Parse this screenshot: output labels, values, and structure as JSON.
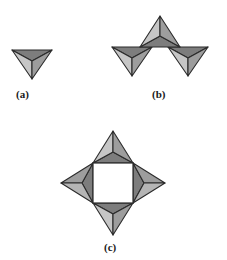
{
  "figure": {
    "background_color": "#ffffff",
    "stroke_color": "#2b2b2b",
    "panels": [
      {
        "id": "a",
        "label": "(a)",
        "caption_text": "(a)",
        "tetrahedra_count": 1,
        "orientation": "apex-down",
        "center": {
          "x": 32,
          "y": 60
        }
      },
      {
        "id": "b",
        "label": "(b)",
        "caption_text": "(b)",
        "tetrahedra_count": 3,
        "orientation": "corner-linked chain: up, down, down",
        "center": {
          "x": 160,
          "y": 52
        }
      },
      {
        "id": "c",
        "label": "(c)",
        "caption_text": "(c)",
        "tetrahedra_count": 4,
        "orientation": "four-membered ring around central square void",
        "center": {
          "x": 113,
          "y": 183
        }
      }
    ],
    "colors": {
      "face_dark": "#7d7d7d",
      "face_medium": "#9d9d9d",
      "face_light": "#c6c6c6",
      "face_lighter": "#b5b5b5",
      "outline": "#2b2b2b",
      "void_fill": "#ffffff"
    },
    "labels": {
      "a": "(a)",
      "b": "(b)",
      "c": "(c)"
    },
    "geometry": {
      "tet_down": {
        "note": "apex-down tetrahedron: top-left, top-right, mid-front-top, bottom apex",
        "points": {
          "tl": [
            -20,
            -10
          ],
          "tr": [
            20,
            -10
          ],
          "mid": [
            0,
            1
          ],
          "apex": [
            0,
            19
          ]
        },
        "faces": [
          {
            "name": "top-face",
            "tone": "face_dark",
            "pts": "tl,tr,mid"
          },
          {
            "name": "left-face",
            "tone": "face_light",
            "pts": "tl,mid,apex"
          },
          {
            "name": "right-face",
            "tone": "face_medium",
            "pts": "tr,mid,apex"
          }
        ]
      },
      "tet_up": {
        "note": "apex-up tetrahedron: bottom-left, bottom-right, mid-front-bottom, top apex",
        "points": {
          "bl": [
            -20,
            10
          ],
          "br": [
            20,
            10
          ],
          "mid": [
            0,
            -1
          ],
          "apex": [
            0,
            -19
          ]
        },
        "faces": [
          {
            "name": "bottom-face",
            "tone": "face_dark",
            "pts": "bl,br,mid"
          },
          {
            "name": "left-face",
            "tone": "face_light",
            "pts": "bl,mid,apex"
          },
          {
            "name": "right-face",
            "tone": "face_medium",
            "pts": "br,mid,apex"
          }
        ]
      }
    }
  }
}
